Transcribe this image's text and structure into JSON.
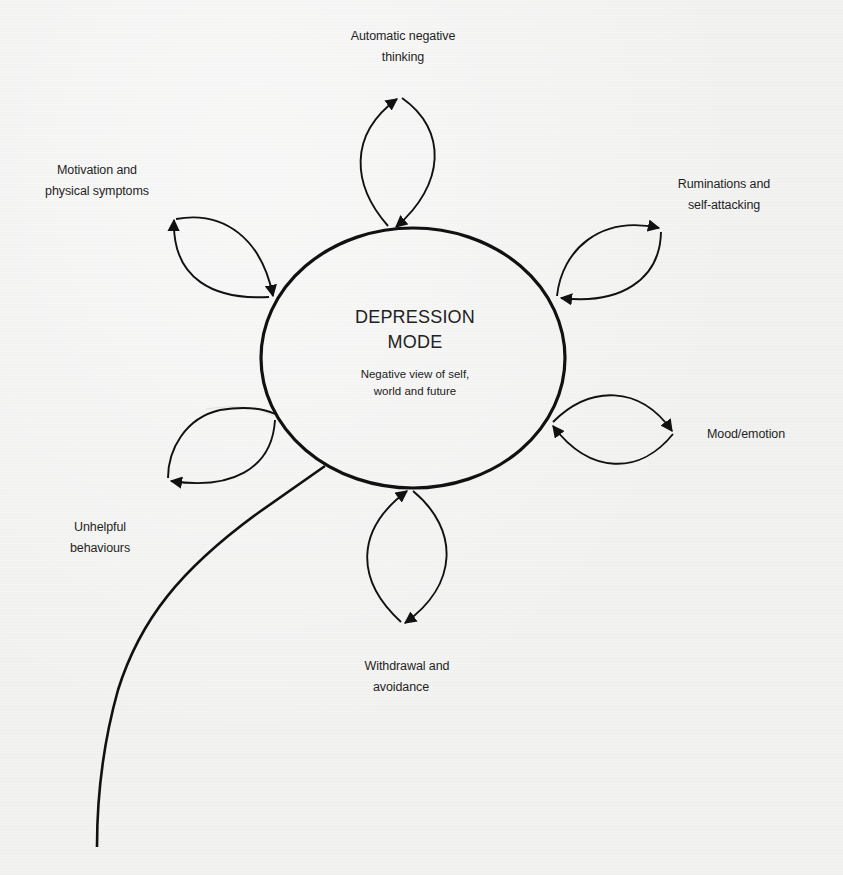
{
  "diagram": {
    "type": "cycle-flower",
    "center": {
      "title_line1": "DEPRESSION",
      "title_line2": "MODE",
      "subtitle_line1": "Negative view of self,",
      "subtitle_line2": "world and future"
    },
    "nodes": [
      {
        "id": "automatic-negative-thinking",
        "line1": "Automatic negative",
        "line2": "thinking",
        "position": "top"
      },
      {
        "id": "ruminations",
        "line1": "Ruminations and",
        "line2": "self-attacking",
        "position": "top-right"
      },
      {
        "id": "mood-emotion",
        "line1": "Mood/emotion",
        "line2": "",
        "position": "right"
      },
      {
        "id": "withdrawal-avoidance",
        "line1": "Withdrawal and",
        "line2": "avoidance",
        "position": "bottom"
      },
      {
        "id": "unhelpful-behaviours",
        "line1": "Unhelpful",
        "line2": "behaviours",
        "position": "left"
      },
      {
        "id": "motivation-physical",
        "line1": "Motivation and",
        "line2": "physical symptoms",
        "position": "top-left"
      }
    ],
    "colors": {
      "ink": "#111111",
      "paper": "#f2f2f1"
    }
  }
}
